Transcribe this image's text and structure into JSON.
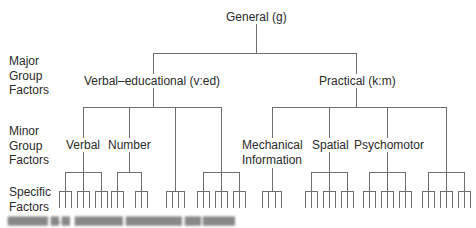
{
  "diagram": {
    "type": "hierarchical-tree",
    "root": {
      "label": "General (g)"
    },
    "levels": [
      {
        "label_lines": [
          "Major",
          "Group",
          "Factors"
        ]
      },
      {
        "label_lines": [
          "Minor",
          "Group",
          "Factors"
        ]
      },
      {
        "label_lines": [
          "Specific",
          "Factors"
        ]
      }
    ],
    "major_groups": [
      {
        "label": "Verbal–educational (v:ed)",
        "minor_groups": [
          {
            "label": "Verbal",
            "specific_clusters": 3
          },
          {
            "label": "Number",
            "specific_clusters": 2
          },
          {
            "label": "",
            "specific_clusters": 1
          },
          {
            "label": "",
            "specific_clusters": 2
          }
        ]
      },
      {
        "label": "Practical (k:m)",
        "minor_groups": [
          {
            "label": "Mechanical Information",
            "label_lines": [
              "Mechanical",
              "Information"
            ],
            "specific_clusters": 1
          },
          {
            "label": "Spatial",
            "specific_clusters": 3
          },
          {
            "label": "Psychomotor",
            "specific_clusters": 3
          },
          {
            "label": "",
            "specific_clusters": 3
          }
        ]
      }
    ],
    "line_color": "#6e6e6e",
    "caption": "(illegible figure caption)"
  }
}
